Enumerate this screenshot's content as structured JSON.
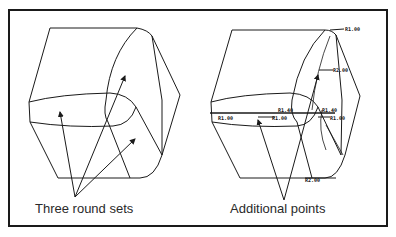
{
  "figure": {
    "left_panel": {
      "caption": "Three round sets"
    },
    "right_panel": {
      "caption": "Additional points",
      "point_labels": [
        "R1.00",
        "R2.00",
        "R1.00",
        "R1.00",
        "R1.40",
        "R1.40",
        "R1.00",
        "R2.00"
      ]
    },
    "colors": {
      "line": "#1a1a1a",
      "background": "#ffffff"
    }
  }
}
